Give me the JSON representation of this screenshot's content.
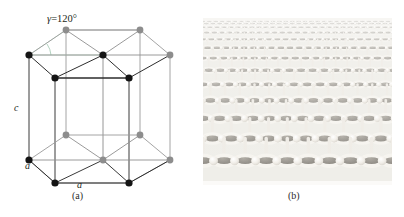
{
  "figure": {
    "top_cut_text": "▫ ▫▫▫  ▫▫▫▫▫  ▫▫▫ ▫▫▫▫  ▫▫▫ ▫▫▫▫  ▫▫▫▫ ▫▫▫▫▫  ▫▫▫▫"
  },
  "panel_a": {
    "caption": "(a)",
    "angle_label": {
      "symbol": "γ",
      "equals": "=",
      "value": "120°",
      "full": "γ=120°"
    },
    "axis_labels": {
      "c": "c",
      "a_left": "a",
      "a_bottom": "a"
    },
    "colors": {
      "atom_front": "#1a1a1a",
      "atom_back": "#8d8d8d",
      "edge_front": "#3a3a3a",
      "edge_back": "#9a9a9a",
      "angle_arc": "#b9d6c4",
      "background": "#ffffff"
    },
    "geometry": {
      "cell_type": "hexagonal unit cell",
      "gamma_degrees": 120,
      "top_face_y": 22,
      "bottom_face_y": 127,
      "pillar_count": 7
    }
  },
  "panel_b": {
    "caption": "(b)",
    "description": "graphene honeycomb lattice perspective render",
    "colors": {
      "bond": "#f4f2ee",
      "ring_dark": "#7f7b74",
      "ring_light": "#b6b2aa",
      "background": "#f3f2ef"
    },
    "lattice": {
      "type": "honeycomb",
      "rows": 13,
      "perspective": "receding to horizon"
    }
  }
}
